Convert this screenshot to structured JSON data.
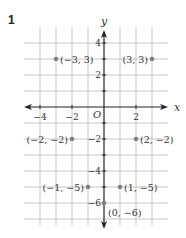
{
  "problem": {
    "number": "1"
  },
  "axes": {
    "x_label": "x",
    "y_label": "y",
    "origin_label": "O",
    "x_ticks": [
      {
        "value": -4,
        "label": "−4"
      },
      {
        "value": -2,
        "label": "−2"
      },
      {
        "value": 2,
        "label": "2"
      }
    ],
    "y_ticks": [
      {
        "value": 4,
        "label": "4"
      },
      {
        "value": 2,
        "label": "2"
      },
      {
        "value": -2,
        "label": "−2"
      },
      {
        "value": -4,
        "label": "−4"
      },
      {
        "value": -6,
        "label": "−6"
      }
    ]
  },
  "grid": {
    "x_min": -4,
    "x_max": 3,
    "y_min": -7,
    "y_max": 4,
    "color": "#b0b0b0"
  },
  "points": [
    {
      "x": -3,
      "y": 3,
      "label": "(−3, 3)",
      "label_side": "right"
    },
    {
      "x": 3,
      "y": 3,
      "label": "(3, 3)",
      "label_side": "left"
    },
    {
      "x": -2,
      "y": -2,
      "label": "(−2, −2)",
      "label_side": "left"
    },
    {
      "x": 2,
      "y": -2,
      "label": "(2, −2)",
      "label_side": "right"
    },
    {
      "x": -1,
      "y": -5,
      "label": "(−1, −5)",
      "label_side": "left"
    },
    {
      "x": 1,
      "y": -5,
      "label": "(1, −5)",
      "label_side": "right"
    },
    {
      "x": 0,
      "y": -6,
      "label": "(0, −6)",
      "label_side": "below-right"
    }
  ],
  "colors": {
    "axis": "#222222",
    "point": "#808080",
    "grid": "#b8b8b8",
    "text": "#333333"
  }
}
